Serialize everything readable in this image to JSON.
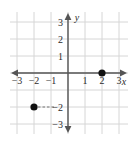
{
  "chart_data": {
    "type": "scatter",
    "title": "",
    "subtitle": "",
    "xlabel": "x",
    "ylabel": "y",
    "xlim": [
      -3.4,
      3.5
    ],
    "ylim": [
      -3.6,
      3.6
    ],
    "grid": true,
    "grid_spacing": 1,
    "legend": "none",
    "x_ticks": [
      -3,
      -2,
      -1,
      1,
      2,
      3
    ],
    "y_ticks": [
      3,
      2,
      1,
      -2,
      -3
    ],
    "x_tick_labels": [
      "−3",
      "−2",
      "−1",
      "1",
      "2",
      "3"
    ],
    "y_tick_labels": [
      "3",
      "2",
      "1",
      "−2",
      "−3"
    ],
    "points": [
      {
        "name": "point-2-0",
        "x": 2,
        "y": 0,
        "label": "",
        "leader": "none"
      },
      {
        "name": "point-neg2-neg2",
        "x": -2,
        "y": -2,
        "label": "",
        "leader": "dashed-to-y-axis"
      }
    ],
    "marker_color": "#111111",
    "marker_radius": 3.6,
    "axis_color": "#555555",
    "grid_color": "#d6d6d6",
    "background_color": "#ffffff"
  },
  "axes": {
    "x_axis_label": "x",
    "y_axis_label": "y",
    "x_axis_arrows": "both",
    "y_axis_arrows": "both"
  }
}
